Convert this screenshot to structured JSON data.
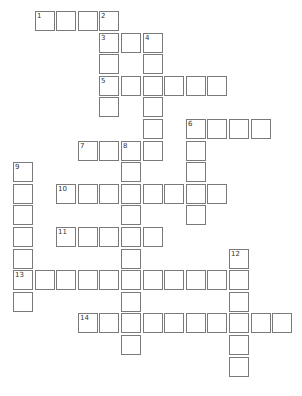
{
  "puzzle": {
    "type": "crossword",
    "cell_size": 21.6,
    "origin": {
      "x": 13,
      "y": 11
    },
    "cells": [
      [
        1,
        0
      ],
      [
        2,
        0
      ],
      [
        3,
        0
      ],
      [
        4,
        0
      ],
      [
        4,
        1
      ],
      [
        5,
        1
      ],
      [
        6,
        1
      ],
      [
        4,
        2
      ],
      [
        6,
        2
      ],
      [
        4,
        3
      ],
      [
        5,
        3
      ],
      [
        6,
        3
      ],
      [
        7,
        3
      ],
      [
        8,
        3
      ],
      [
        9,
        3
      ],
      [
        4,
        4
      ],
      [
        6,
        4
      ],
      [
        6,
        5
      ],
      [
        8,
        5
      ],
      [
        9,
        5
      ],
      [
        10,
        5
      ],
      [
        11,
        5
      ],
      [
        3,
        6
      ],
      [
        4,
        6
      ],
      [
        5,
        6
      ],
      [
        6,
        6
      ],
      [
        8,
        6
      ],
      [
        0,
        7
      ],
      [
        5,
        7
      ],
      [
        8,
        7
      ],
      [
        0,
        8
      ],
      [
        2,
        8
      ],
      [
        3,
        8
      ],
      [
        4,
        8
      ],
      [
        5,
        8
      ],
      [
        6,
        8
      ],
      [
        7,
        8
      ],
      [
        8,
        8
      ],
      [
        9,
        8
      ],
      [
        0,
        9
      ],
      [
        5,
        9
      ],
      [
        8,
        9
      ],
      [
        0,
        10
      ],
      [
        2,
        10
      ],
      [
        3,
        10
      ],
      [
        4,
        10
      ],
      [
        5,
        10
      ],
      [
        6,
        10
      ],
      [
        0,
        11
      ],
      [
        5,
        11
      ],
      [
        10,
        11
      ],
      [
        0,
        12
      ],
      [
        1,
        12
      ],
      [
        2,
        12
      ],
      [
        3,
        12
      ],
      [
        4,
        12
      ],
      [
        5,
        12
      ],
      [
        6,
        12
      ],
      [
        7,
        12
      ],
      [
        8,
        12
      ],
      [
        9,
        12
      ],
      [
        10,
        12
      ],
      [
        0,
        13
      ],
      [
        5,
        13
      ],
      [
        10,
        13
      ],
      [
        3,
        14
      ],
      [
        4,
        14
      ],
      [
        5,
        14
      ],
      [
        6,
        14
      ],
      [
        7,
        14
      ],
      [
        8,
        14
      ],
      [
        9,
        14
      ],
      [
        10,
        14
      ],
      [
        11,
        14
      ],
      [
        12,
        14
      ],
      [
        5,
        15
      ],
      [
        10,
        15
      ],
      [
        10,
        16
      ]
    ],
    "numbers": [
      {
        "n": "1",
        "col": 1,
        "row": 0
      },
      {
        "n": "2",
        "col": 4,
        "row": 0
      },
      {
        "n": "3",
        "col": 4,
        "row": 1
      },
      {
        "n": "4",
        "col": 6,
        "row": 1
      },
      {
        "n": "5",
        "col": 4,
        "row": 3
      },
      {
        "n": "6",
        "col": 8,
        "row": 5
      },
      {
        "n": "7",
        "col": 3,
        "row": 6
      },
      {
        "n": "8",
        "col": 5,
        "row": 6
      },
      {
        "n": "9",
        "col": 0,
        "row": 7
      },
      {
        "n": "10",
        "col": 2,
        "row": 8
      },
      {
        "n": "11",
        "col": 2,
        "row": 10
      },
      {
        "n": "12",
        "col": 10,
        "row": 11
      },
      {
        "n": "13",
        "col": 0,
        "row": 12
      },
      {
        "n": "14",
        "col": 3,
        "row": 14
      }
    ]
  }
}
